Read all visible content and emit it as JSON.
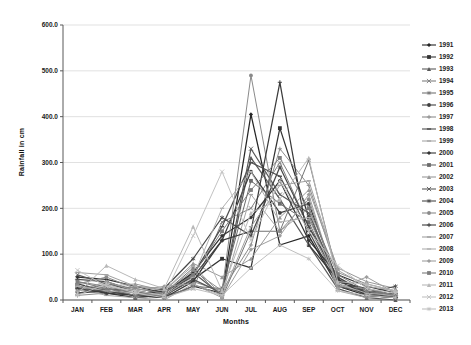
{
  "chart_data": {
    "type": "line",
    "title": "",
    "xlabel": "Months",
    "ylabel": "Rainfall in cm",
    "ylim": [
      0,
      600
    ],
    "ytick_labels": [
      "0.0",
      "100.0",
      "200.0",
      "300.0",
      "400.0",
      "500.0",
      "600.0"
    ],
    "grid": true,
    "legend_position": "right",
    "categories": [
      "JAN",
      "FEB",
      "MAR",
      "APR",
      "MAY",
      "JUN",
      "JUL",
      "AUG",
      "SEP",
      "OCT",
      "NOV",
      "DEC"
    ],
    "series": [
      {
        "name": "1991",
        "color": "#262626",
        "marker": "diamond",
        "values": [
          25,
          20,
          10,
          5,
          30,
          15,
          405,
          120,
          140,
          30,
          10,
          5
        ]
      },
      {
        "name": "1992",
        "color": "#333333",
        "marker": "square",
        "values": [
          30,
          15,
          5,
          10,
          45,
          90,
          70,
          375,
          180,
          45,
          15,
          10
        ]
      },
      {
        "name": "1993",
        "color": "#595959",
        "marker": "triangle",
        "values": [
          15,
          25,
          20,
          5,
          60,
          10,
          310,
          220,
          120,
          25,
          5,
          0
        ]
      },
      {
        "name": "1994",
        "color": "#808080",
        "marker": "x",
        "values": [
          40,
          30,
          15,
          10,
          25,
          170,
          200,
          300,
          160,
          35,
          20,
          5
        ]
      },
      {
        "name": "1995",
        "color": "#737373",
        "marker": "star",
        "values": [
          20,
          35,
          25,
          15,
          70,
          5,
          150,
          150,
          305,
          50,
          10,
          15
        ]
      },
      {
        "name": "1996",
        "color": "#404040",
        "marker": "circle",
        "values": [
          35,
          20,
          10,
          20,
          50,
          130,
          280,
          190,
          210,
          40,
          25,
          10
        ]
      },
      {
        "name": "1997",
        "color": "#8c8c8c",
        "marker": "plus",
        "values": [
          10,
          15,
          30,
          25,
          40,
          20,
          120,
          330,
          250,
          60,
          35,
          20
        ]
      },
      {
        "name": "1998",
        "color": "#4d4d4d",
        "marker": "dash",
        "values": [
          45,
          40,
          20,
          10,
          55,
          160,
          300,
          270,
          150,
          30,
          15,
          5
        ]
      },
      {
        "name": "1999",
        "color": "#a6a6a6",
        "marker": "dash",
        "values": [
          25,
          10,
          5,
          0,
          35,
          10,
          230,
          150,
          200,
          20,
          5,
          10
        ]
      },
      {
        "name": "2000",
        "color": "#333333",
        "marker": "diamond",
        "values": [
          50,
          45,
          30,
          15,
          60,
          140,
          180,
          260,
          130,
          55,
          30,
          15
        ]
      },
      {
        "name": "2001",
        "color": "#6b6b6b",
        "marker": "square",
        "values": [
          30,
          25,
          15,
          5,
          30,
          25,
          260,
          210,
          170,
          35,
          10,
          5
        ]
      },
      {
        "name": "2002",
        "color": "#999999",
        "marker": "triangle",
        "values": [
          20,
          30,
          35,
          20,
          80,
          50,
          90,
          180,
          240,
          70,
          40,
          25
        ]
      },
      {
        "name": "2003",
        "color": "#595959",
        "marker": "x",
        "values": [
          55,
          35,
          20,
          10,
          45,
          15,
          330,
          230,
          190,
          40,
          20,
          10
        ]
      },
      {
        "name": "2004",
        "color": "#474747",
        "marker": "star",
        "values": [
          15,
          20,
          10,
          25,
          90,
          180,
          140,
          290,
          160,
          50,
          15,
          30
        ]
      },
      {
        "name": "2005",
        "color": "#8a8a8a",
        "marker": "circle",
        "values": [
          35,
          50,
          25,
          15,
          65,
          20,
          490,
          150,
          220,
          30,
          25,
          10
        ]
      },
      {
        "name": "2006",
        "color": "#3b3b3b",
        "marker": "plus",
        "values": [
          25,
          15,
          10,
          5,
          40,
          130,
          150,
          475,
          120,
          45,
          10,
          5
        ]
      },
      {
        "name": "2007",
        "color": "#a0a0a0",
        "marker": "dash",
        "values": [
          60,
          55,
          30,
          20,
          75,
          10,
          160,
          250,
          260,
          65,
          30,
          20
        ]
      },
      {
        "name": "2008",
        "color": "#b0b0b0",
        "marker": "dash",
        "values": [
          30,
          20,
          15,
          10,
          50,
          200,
          280,
          170,
          180,
          35,
          15,
          10
        ]
      },
      {
        "name": "2009",
        "color": "#9e9e9e",
        "marker": "diamond",
        "values": [
          20,
          40,
          20,
          30,
          35,
          5,
          110,
          140,
          230,
          25,
          50,
          15
        ]
      },
      {
        "name": "2010",
        "color": "#7d7d7d",
        "marker": "square",
        "values": [
          40,
          25,
          10,
          15,
          55,
          150,
          240,
          310,
          200,
          55,
          20,
          10
        ]
      },
      {
        "name": "2011",
        "color": "#b8b8b8",
        "marker": "triangle",
        "values": [
          15,
          75,
          45,
          25,
          160,
          20,
          190,
          220,
          310,
          40,
          35,
          20
        ]
      },
      {
        "name": "2012",
        "color": "#c2c2c2",
        "marker": "x",
        "values": [
          65,
          30,
          20,
          10,
          140,
          280,
          130,
          260,
          150,
          75,
          25,
          15
        ]
      },
      {
        "name": "2013",
        "color": "#bfbfbf",
        "marker": "star",
        "values": [
          10,
          35,
          15,
          5,
          25,
          10,
          70,
          120,
          90,
          20,
          10,
          5
        ]
      }
    ],
    "colors": {
      "gridline": "#d9d9d9",
      "axis": "#595959",
      "text": "#1a1a1a",
      "background": "#ffffff"
    }
  }
}
